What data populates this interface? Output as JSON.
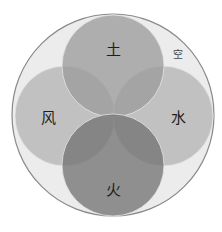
{
  "diagram": {
    "type": "venn-elements",
    "outer": {
      "label": "空",
      "cx": 113,
      "cy": 115,
      "r": 101,
      "fill": "#ececec",
      "stroke": "#8a8a8a"
    },
    "circles": [
      {
        "id": "earth",
        "label": "土",
        "cx": 113,
        "cy": 66,
        "r": 51,
        "fill": "#9a9a9a",
        "opacity": 0.75
      },
      {
        "id": "wind",
        "label": "风",
        "cx": 65,
        "cy": 116,
        "r": 50,
        "fill": "#b0b0b0",
        "opacity": 0.7
      },
      {
        "id": "water",
        "label": "水",
        "cx": 163,
        "cy": 116,
        "r": 50,
        "fill": "#b0b0b0",
        "opacity": 0.7
      },
      {
        "id": "fire",
        "label": "火",
        "cx": 113,
        "cy": 165,
        "r": 51,
        "fill": "#7e7e7e",
        "opacity": 0.8
      }
    ],
    "labels": {
      "space": "空",
      "earth": "土",
      "wind": "风",
      "water": "水",
      "fire": "火"
    }
  }
}
